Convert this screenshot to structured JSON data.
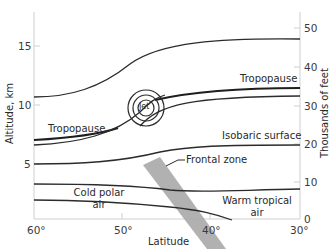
{
  "diagram": {
    "title": "",
    "axes": {
      "left": {
        "label": "Altitude, km",
        "ticks": [
          "15",
          "10",
          "5"
        ]
      },
      "right": {
        "label": "Thousands of feet",
        "ticks": [
          "50",
          "40",
          "30",
          "20",
          "10",
          "0"
        ]
      },
      "bottom": {
        "label": "Latitude",
        "ticks": [
          "60°",
          "50°",
          "40°",
          "30°"
        ]
      }
    },
    "labels": {
      "tropopause_left": "Tropopause",
      "tropopause_right": "Tropopause",
      "jet": "Jet",
      "isobaric_surface": "Isobaric surface",
      "frontal_zone": "Frontal zone",
      "cold_polar_air_line1": "Cold polar",
      "cold_polar_air_line2": "air",
      "warm_tropical_air_line1": "Warm tropical",
      "warm_tropical_air_line2": "air"
    },
    "colors": {
      "line": "#2b2b2b",
      "axis": "#c8c8c8",
      "frontal_zone": "#a9a9a9",
      "background": "#ffffff"
    }
  }
}
